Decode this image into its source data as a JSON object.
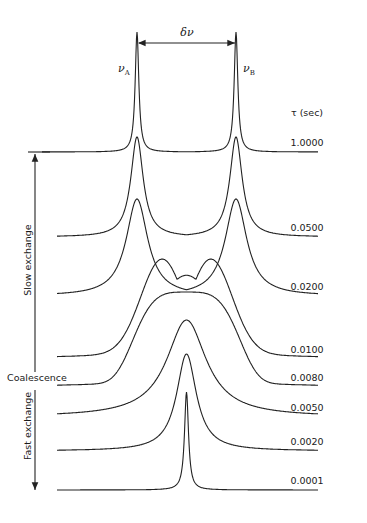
{
  "figure": {
    "separation_label": "δν",
    "peak_a_label": "ν",
    "peak_a_sub": "A",
    "peak_b_label": "ν",
    "peak_b_sub": "B",
    "tau_header": "τ (sec)",
    "regimes": {
      "slow": "Slow exchange",
      "coalescence": "Coalescence",
      "fast": "Fast exchange"
    },
    "spectra": [
      {
        "tau": "1.0000",
        "baseline_y": 152,
        "peak_y": 32,
        "shape": "two-sharp"
      },
      {
        "tau": "0.0500",
        "baseline_y": 237,
        "peak_y": 137,
        "shape": "two-broad"
      },
      {
        "tau": "0.0200",
        "baseline_y": 296,
        "peak_y": 199,
        "shape": "two-broader"
      },
      {
        "tau": "0.0100",
        "baseline_y": 359,
        "peak_y": 266,
        "shape": "merging"
      },
      {
        "tau": "0.0080",
        "baseline_y": 387,
        "peak_y": 292,
        "shape": "flat-top"
      },
      {
        "tau": "0.0050",
        "baseline_y": 417,
        "peak_y": 320,
        "shape": "single-broad"
      },
      {
        "tau": "0.0020",
        "baseline_y": 451,
        "peak_y": 354,
        "shape": "single-narrowing"
      },
      {
        "tau": "0.0001",
        "baseline_y": 490,
        "peak_y": 392,
        "shape": "single-sharp"
      }
    ],
    "peak_a_x": 137,
    "peak_b_x": 236,
    "colors": {
      "ink": "#222222",
      "background": "#ffffff"
    }
  }
}
